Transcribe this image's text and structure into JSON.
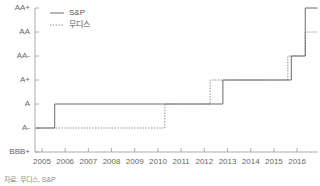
{
  "chart_data": {
    "type": "line",
    "title": "",
    "xlabel": "",
    "ylabel": "",
    "grid": false,
    "legend_position": "top-left",
    "source_note": "자료: 무디스, S&P",
    "x_tick_labels": [
      "2005",
      "2006",
      "2007",
      "2008",
      "2009",
      "2010",
      "2011",
      "2012",
      "2013",
      "2014",
      "2015",
      "2016"
    ],
    "x_tick_values": [
      2005,
      2006,
      2007,
      2008,
      2009,
      2010,
      2011,
      2012,
      2013,
      2014,
      2015,
      2016
    ],
    "xlim": [
      2004.7,
      2016.9
    ],
    "y_tick_labels": [
      "BBB+",
      "A-",
      "A",
      "A+",
      "AA-",
      "AA",
      "AA+"
    ],
    "y_rank_values": [
      0,
      1,
      2,
      3,
      4,
      5,
      6
    ],
    "ylim": [
      0,
      6
    ],
    "series": [
      {
        "name": "S&P",
        "style": "solid",
        "color": "#6b6b6b",
        "steps": [
          {
            "x": 2004.75,
            "rating": "A-",
            "rank": 1
          },
          {
            "x": 2005.55,
            "rating": "A",
            "rank": 2
          },
          {
            "x": 2012.8,
            "rating": "A+",
            "rank": 3
          },
          {
            "x": 2015.75,
            "rating": "AA-",
            "rank": 4
          },
          {
            "x": 2016.35,
            "rating": "AA+",
            "rank": 6
          },
          {
            "x": 2016.88,
            "rating": "AA+",
            "rank": 6
          }
        ]
      },
      {
        "name": "무디스",
        "style": "dashed",
        "color": "#8a8a8a",
        "steps": [
          {
            "x": 2004.75,
            "rating": "A-",
            "rank": 1
          },
          {
            "x": 2010.3,
            "rating": "A",
            "rank": 2
          },
          {
            "x": 2012.25,
            "rating": "A+",
            "rank": 3
          },
          {
            "x": 2015.6,
            "rating": "AA-",
            "rank": 4
          },
          {
            "x": 2016.35,
            "rating": "AA",
            "rank": 5
          },
          {
            "x": 2016.88,
            "rating": "AA",
            "rank": 5
          }
        ]
      }
    ]
  },
  "legend": {
    "items": [
      {
        "label": "S&P",
        "style": "solid"
      },
      {
        "label": "무디스",
        "style": "dashed"
      }
    ]
  },
  "footer": {
    "source": "자료: 무디스, S&P"
  }
}
